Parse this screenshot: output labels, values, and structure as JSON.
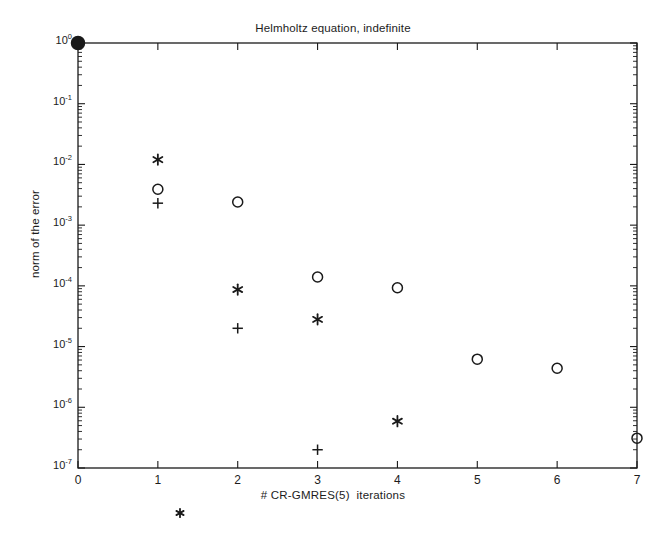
{
  "chart_data": {
    "type": "scatter",
    "title": "Helmholtz equation, indefinite",
    "xlabel": "# CR-GMRES(5)  iterations",
    "ylabel": "norm of the error",
    "yscale": "log",
    "xlim": [
      0,
      7
    ],
    "ylim": [
      1e-07,
      1
    ],
    "grid": false,
    "legend": "none",
    "xticks": [
      "0",
      "1",
      "2",
      "3",
      "4",
      "5",
      "6",
      "7"
    ],
    "xtick_values": [
      0,
      1,
      2,
      3,
      4,
      5,
      6,
      7
    ],
    "ytick_labels": [
      "10",
      "10",
      "10",
      "10",
      "10",
      "10",
      "10",
      "10"
    ],
    "ytick_exponents": [
      "0",
      "-1",
      "-2",
      "-3",
      "-4",
      "-5",
      "-6",
      "-7"
    ],
    "ytick_values": [
      1,
      0.1,
      0.01,
      0.001,
      0.0001,
      1e-05,
      1e-06,
      1e-07
    ],
    "series": [
      {
        "name": "filled-dot",
        "marker": "filled-circle",
        "points": [
          {
            "x": 0,
            "y": 1.0
          }
        ]
      },
      {
        "name": "circle-series",
        "marker": "circle",
        "points": [
          {
            "x": 1,
            "y": 0.0039
          },
          {
            "x": 2,
            "y": 0.0024
          },
          {
            "x": 3,
            "y": 0.00014
          },
          {
            "x": 4,
            "y": 9.3e-05
          },
          {
            "x": 5,
            "y": 6.2e-06
          },
          {
            "x": 6,
            "y": 4.4e-06
          },
          {
            "x": 7,
            "y": 3.1e-07
          }
        ]
      },
      {
        "name": "asterisk-series",
        "marker": "asterisk",
        "points": [
          {
            "x": 1,
            "y": 0.012
          },
          {
            "x": 2,
            "y": 8.7e-05
          },
          {
            "x": 3,
            "y": 2.8e-05
          },
          {
            "x": 4,
            "y": 5.9e-07
          }
        ]
      },
      {
        "name": "plus-series",
        "marker": "plus",
        "points": [
          {
            "x": 1,
            "y": 0.0023
          },
          {
            "x": 2,
            "y": 2e-05
          },
          {
            "x": 3,
            "y": 2e-07
          }
        ]
      }
    ],
    "artifacts": [
      {
        "name": "stray-asterisk",
        "glyph": "*",
        "x_px": 180,
        "y_px": 513
      }
    ],
    "colors": {
      "marker": "#1a1a1a",
      "axis": "#1a1a1a",
      "background": "#ffffff"
    }
  }
}
